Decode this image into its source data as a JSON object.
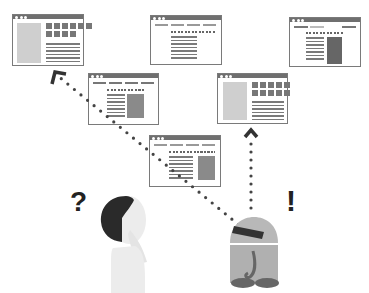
{
  "illustration": {
    "title": "Human vs robot web navigation",
    "human_symbol": "?",
    "robot_symbol": "!",
    "colors": {
      "frame": "#7a7a7a",
      "titlebar": "#6f6f6f",
      "placeholder_light": "#cfcfcf",
      "placeholder_dark": "#666666",
      "hair": "#2a2a2a",
      "skin": "#ececec",
      "robot_body": "#b0b0b0",
      "robot_visor": "#333333",
      "robot_feet": "#666666",
      "path_dots": "#444444"
    },
    "windows": [
      {
        "id": "w1",
        "layout": "sidebar-left-grid-right"
      },
      {
        "id": "w2",
        "layout": "nav-centered-text"
      },
      {
        "id": "w3",
        "layout": "nav-text-dark-panel"
      },
      {
        "id": "w4",
        "layout": "nav-text-panel"
      },
      {
        "id": "w5",
        "layout": "sidebar-left-grid-right"
      },
      {
        "id": "w6",
        "layout": "nav-text-panel"
      }
    ],
    "paths": [
      {
        "from": "robot",
        "to": "w1",
        "style": "dotted-arrow"
      },
      {
        "from": "robot",
        "to": "w5",
        "style": "dotted-arrow"
      }
    ]
  }
}
